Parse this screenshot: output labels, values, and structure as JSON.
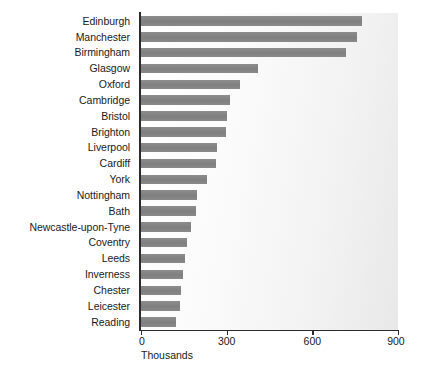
{
  "chart_data": {
    "type": "bar",
    "orientation": "horizontal",
    "title": "",
    "xlabel": "Thousands",
    "ylabel": "",
    "xlim": [
      0,
      900
    ],
    "xticks": [
      0,
      300,
      600,
      900
    ],
    "xtick_labels": [
      "0",
      "300",
      "600",
      "900"
    ],
    "grid": false,
    "legend": false,
    "bar_color": "#848484",
    "plot_background": "#f2f2f2",
    "categories": [
      "Edinburgh",
      "Manchester",
      "Birmingham",
      "Glasgow",
      "Oxford",
      "Cambridge",
      "Bristol",
      "Brighton",
      "Liverpool",
      "Cardiff",
      "York",
      "Nottingham",
      "Bath",
      "Newcastle-upon-Tyne",
      "Coventry",
      "Leeds",
      "Inverness",
      "Chester",
      "Leicester",
      "Reading"
    ],
    "values": [
      773,
      756,
      717,
      408,
      345,
      310,
      302,
      299,
      267,
      264,
      232,
      196,
      193,
      176,
      162,
      155,
      148,
      141,
      137,
      123
    ]
  }
}
